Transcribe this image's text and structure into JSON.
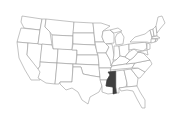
{
  "map": {
    "region": "United States",
    "highlighted_state": "Mississippi",
    "colors": {
      "background": "#ffffff",
      "state_fill": "#ffffff",
      "state_border": "#9a9a9a",
      "highlight_fill": "#404040"
    }
  }
}
